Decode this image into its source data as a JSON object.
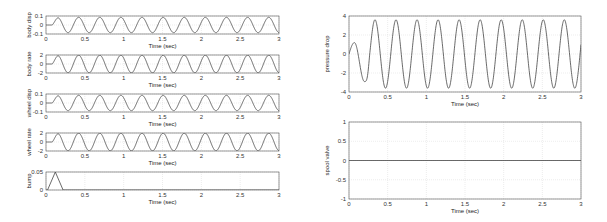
{
  "chart_data": [
    {
      "type": "line",
      "id": "body_disp",
      "xlabel": "Time (sec)",
      "ylabel": "body disp",
      "xlim": [
        0,
        3
      ],
      "ylim": [
        -0.1,
        0.1
      ],
      "xticks": [
        "0",
        "0.5",
        "1",
        "1.5",
        "2",
        "2.5",
        "3"
      ],
      "yticks": [
        "0.1",
        "0",
        "-0.1"
      ],
      "grid": true,
      "signal": {
        "kind": "sine",
        "amplitude": 0.085,
        "period": 0.272,
        "startup": 0.1
      }
    },
    {
      "type": "line",
      "id": "body_rate",
      "xlabel": "Time (sec)",
      "ylabel": "body rate",
      "xlim": [
        0,
        3
      ],
      "ylim": [
        -2,
        2
      ],
      "xticks": [
        "0",
        "0.5",
        "1",
        "1.5",
        "2",
        "2.5",
        "3"
      ],
      "yticks": [
        "2",
        "0",
        "-2"
      ],
      "grid": true,
      "signal": {
        "kind": "sine",
        "amplitude": 1.95,
        "period": 0.272,
        "startup": 0.1
      }
    },
    {
      "type": "line",
      "id": "wheel_disp",
      "xlabel": "Time (sec)",
      "ylabel": "wheel disp",
      "xlim": [
        0,
        3
      ],
      "ylim": [
        -0.1,
        0.1
      ],
      "xticks": [
        "0",
        "0.5",
        "1",
        "1.5",
        "2",
        "2.5",
        "3"
      ],
      "yticks": [
        "0.1",
        "0",
        "-0.1"
      ],
      "grid": true,
      "signal": {
        "kind": "sine",
        "amplitude": 0.085,
        "period": 0.272,
        "startup": 0.1
      }
    },
    {
      "type": "line",
      "id": "wheel_rate",
      "xlabel": "Time (sec)",
      "ylabel": "wheel rate",
      "xlim": [
        0,
        3
      ],
      "ylim": [
        -2,
        2
      ],
      "xticks": [
        "0",
        "0.5",
        "1",
        "1.5",
        "2",
        "2.5",
        "3"
      ],
      "yticks": [
        "2",
        "0",
        "-2"
      ],
      "grid": true,
      "signal": {
        "kind": "sine",
        "amplitude": 1.95,
        "period": 0.272,
        "startup": 0.1
      }
    },
    {
      "type": "line",
      "id": "bump",
      "xlabel": "Time (sec)",
      "ylabel": "bump",
      "xlim": [
        0,
        3
      ],
      "ylim": [
        0,
        0.05
      ],
      "xticks": [
        "0",
        "0.5",
        "1",
        "1.5",
        "2",
        "2.5",
        "3"
      ],
      "yticks": [
        "0.05",
        "0"
      ],
      "grid": true,
      "x": [
        0,
        0.02,
        0.12,
        0.22,
        3
      ],
      "y": [
        0,
        0,
        0.05,
        0,
        0
      ]
    },
    {
      "type": "line",
      "id": "pressure_drop",
      "xlabel": "Time (sec)",
      "ylabel": "pressure drop",
      "xlim": [
        0,
        3
      ],
      "ylim": [
        -4,
        4
      ],
      "xticks": [
        "0",
        "0.5",
        "1",
        "1.5",
        "2",
        "2.5",
        "3"
      ],
      "yticks": [
        "4",
        "2",
        "0",
        "-2",
        "-4"
      ],
      "grid": true,
      "signal": {
        "kind": "sine",
        "amplitude": 3.6,
        "period": 0.272,
        "startup": 0.25,
        "initial_peak": 1.2,
        "initial_trough": -2.9
      }
    },
    {
      "type": "line",
      "id": "spool_valve",
      "xlabel": "Time (sec)",
      "ylabel": "spool valve",
      "xlim": [
        0,
        3
      ],
      "ylim": [
        -1,
        1
      ],
      "xticks": [
        "0",
        "0.5",
        "1",
        "1.5",
        "2",
        "2.5",
        "3"
      ],
      "yticks": [
        "1",
        "0.5",
        "0",
        "-0.5",
        "-1"
      ],
      "grid": true,
      "x": [
        0,
        3
      ],
      "y": [
        0,
        0
      ]
    }
  ],
  "layout": [
    {
      "x": 46,
      "y": 16,
      "w": 233,
      "h": 18
    },
    {
      "x": 46,
      "y": 55,
      "w": 233,
      "h": 18
    },
    {
      "x": 46,
      "y": 94,
      "w": 233,
      "h": 18
    },
    {
      "x": 46,
      "y": 133,
      "w": 233,
      "h": 18
    },
    {
      "x": 46,
      "y": 172,
      "w": 233,
      "h": 18
    },
    {
      "x": 349,
      "y": 16,
      "w": 232,
      "h": 76
    },
    {
      "x": 349,
      "y": 122,
      "w": 232,
      "h": 77
    }
  ],
  "colors": {
    "line": "#444444",
    "axis": "#555555",
    "grid": "#d9d9d9"
  }
}
